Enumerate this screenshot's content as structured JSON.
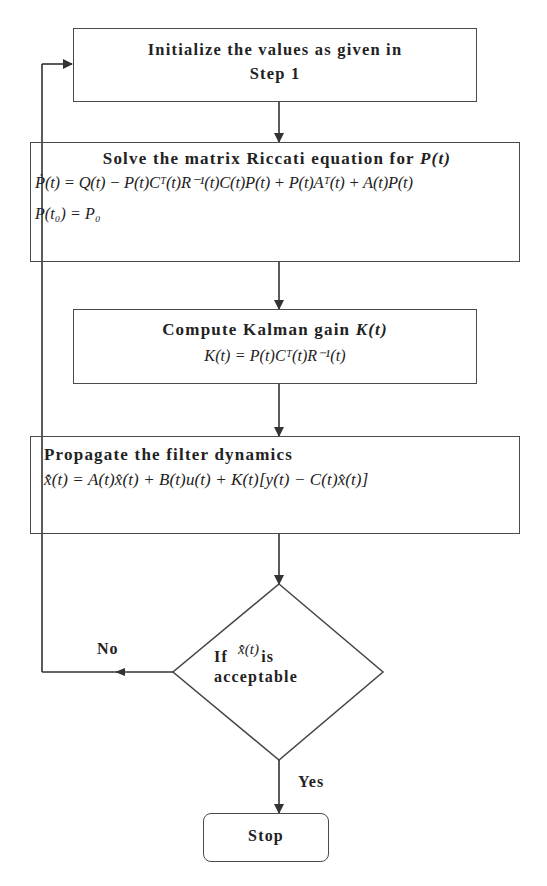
{
  "flowchart": {
    "init": {
      "title_line1": "Initialize the values as given in",
      "title_line2": "Step 1"
    },
    "riccati": {
      "title": "Solve the matrix Riccati equation for ",
      "title_var": "P(t)",
      "equation": "Ṗ(t) = Q(t) − P(t)Cᵀ(t)R⁻¹(t)C(t)P(t) + P(t)Aᵀ(t) + A(t)P(t)",
      "initial_condition": "P(t₀) = P₀"
    },
    "kalman_gain": {
      "title": "Compute Kalman gain ",
      "title_var": "K(t)",
      "equation": "K(t) = P(t)Cᵀ(t)R⁻¹(t)"
    },
    "propagate": {
      "title": "Propagate the filter dynamics",
      "equation": "x̂̇(t) = A(t)x̂(t) + B(t)u(t) + K(t)[y(t) − C(t)x̂(t)]"
    },
    "decision": {
      "prefix": "If",
      "var": "x̂̇(t)",
      "suffix": "is",
      "line2": "acceptable"
    },
    "labels": {
      "no": "No",
      "yes": "Yes"
    },
    "stop": {
      "label": "Stop"
    }
  }
}
